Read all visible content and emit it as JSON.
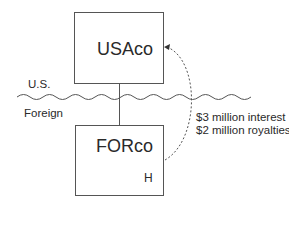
{
  "diagram": {
    "entities": {
      "parent": {
        "name": "USAco"
      },
      "subsidiary": {
        "name": "FORco",
        "marker": "H"
      }
    },
    "border": {
      "upper_label": "U.S.",
      "lower_label": "Foreign"
    },
    "flow": {
      "lines": [
        "$3 million interest",
        "$2 million royalties"
      ],
      "direction": "FORco to USAco"
    },
    "colors": {
      "line": "#555555",
      "text": "#2a2a2a",
      "background": "#ffffff"
    }
  }
}
